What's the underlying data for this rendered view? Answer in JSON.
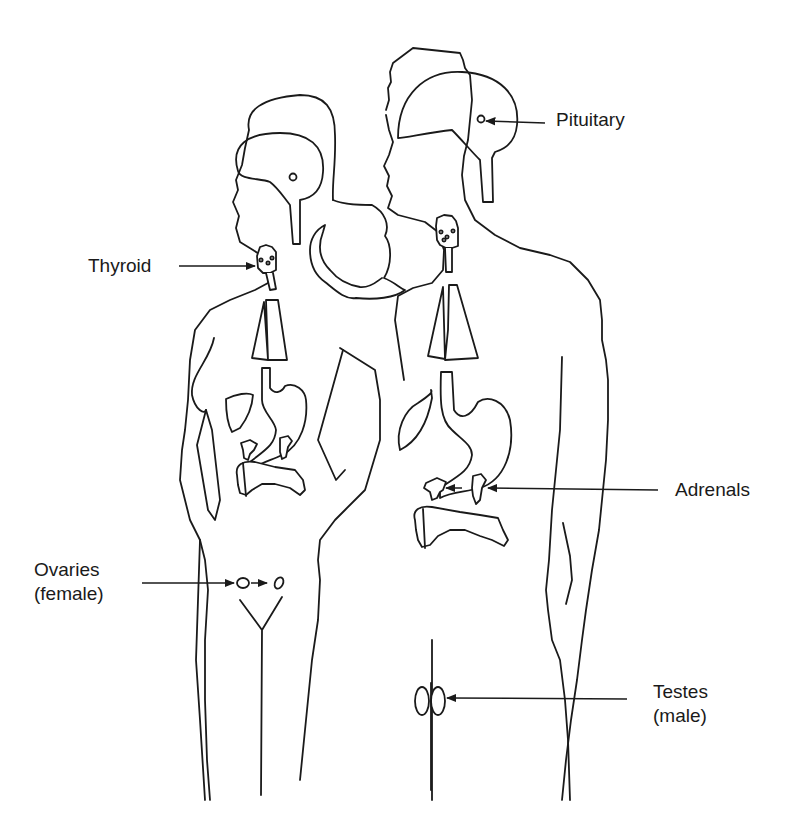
{
  "diagram": {
    "figures": [
      "female",
      "male"
    ],
    "line_color": "#1a1a1a",
    "background": "#ffffff"
  },
  "labels": {
    "pituitary": {
      "line1": "Pituitary"
    },
    "thyroid": {
      "line1": "Thyroid"
    },
    "adrenals": {
      "line1": "Adrenals"
    },
    "ovaries": {
      "line1": "Ovaries",
      "line2": "(female)"
    },
    "testes": {
      "line1": "Testes",
      "line2": "(male)"
    }
  }
}
